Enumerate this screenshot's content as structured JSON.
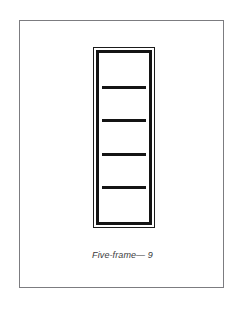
{
  "figure": {
    "caption": "Five-frame— 9",
    "label_text": "Five-frame",
    "reference_numeral": "9",
    "pane_count": 5,
    "panes": [
      {
        "index": 1,
        "label": ""
      },
      {
        "index": 2,
        "label": ""
      },
      {
        "index": 3,
        "label": ""
      },
      {
        "index": 4,
        "label": ""
      },
      {
        "index": 5,
        "label": ""
      }
    ],
    "colors": {
      "page_background": "#ffffff",
      "card_background": "#ffffff",
      "card_border": "#7c7c80",
      "frame_outer_line": "#1b1b1b",
      "frame_inner_line": "#141414",
      "pane_fill": "#ffffff",
      "caption_text": "#3a3a3c"
    }
  }
}
